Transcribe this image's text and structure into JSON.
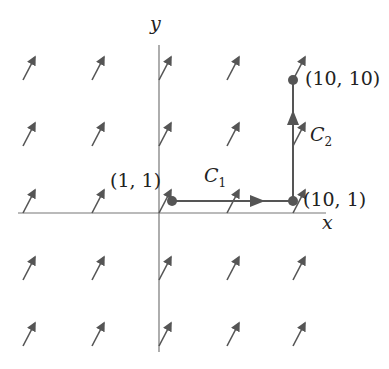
{
  "diagram": {
    "type": "vector-field-line-integral",
    "axes": {
      "x_label": "x",
      "y_label": "y"
    },
    "points": [
      {
        "label": "(1, 1)",
        "x": 1,
        "y": 1
      },
      {
        "label": "(10, 1)",
        "x": 10,
        "y": 1
      },
      {
        "label": "(10, 10)",
        "x": 10,
        "y": 10
      }
    ],
    "curves": [
      {
        "name": "C",
        "sub": "1",
        "from": "(1, 1)",
        "to": "(10, 1)",
        "direction": "right"
      },
      {
        "name": "C",
        "sub": "2",
        "from": "(10, 1)",
        "to": "(10, 10)",
        "direction": "up"
      }
    ],
    "vector_field": {
      "grid_cols": 5,
      "grid_rows": 5,
      "direction": "up-right (constant)"
    },
    "colors": {
      "stroke": "#555555",
      "text": "#222222",
      "background": "#ffffff"
    }
  }
}
